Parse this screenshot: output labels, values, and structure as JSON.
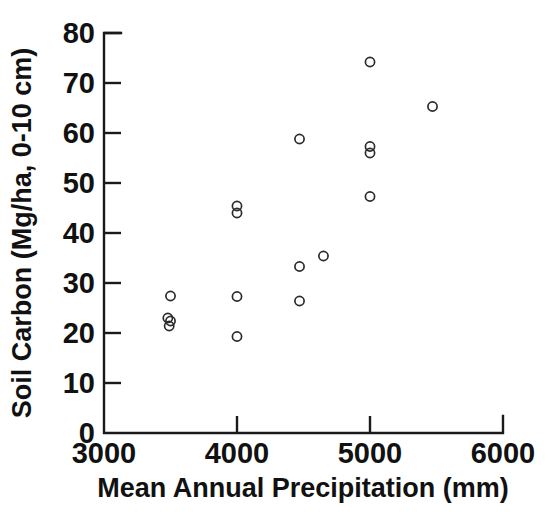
{
  "chart_data": {
    "type": "scatter",
    "title": "",
    "xlabel": "Mean Annual Precipitation  (mm)",
    "ylabel": "Soil Carbon (Mg/ha, 0-10 cm)",
    "xlim": [
      3000,
      6000
    ],
    "ylim": [
      0,
      80
    ],
    "xticks": [
      3000,
      4000,
      5000,
      6000
    ],
    "xtick_labels": [
      "3000",
      "4000",
      "5000",
      "6000"
    ],
    "yticks": [
      0,
      10,
      20,
      30,
      40,
      50,
      60,
      70,
      80
    ],
    "ytick_labels": [
      "0",
      "10",
      "20",
      "30",
      "40",
      "50",
      "60",
      "70",
      "80"
    ],
    "grid": false,
    "legend": null,
    "marker": "open-circle",
    "marker_color": "#2b2b2b",
    "points": [
      {
        "x": 3500,
        "y": 27.4
      },
      {
        "x": 3480,
        "y": 23.0
      },
      {
        "x": 3500,
        "y": 22.4
      },
      {
        "x": 3490,
        "y": 21.4
      },
      {
        "x": 4000,
        "y": 45.4
      },
      {
        "x": 4000,
        "y": 44.0
      },
      {
        "x": 4000,
        "y": 27.3
      },
      {
        "x": 4000,
        "y": 19.3
      },
      {
        "x": 4470,
        "y": 58.8
      },
      {
        "x": 4470,
        "y": 33.3
      },
      {
        "x": 4650,
        "y": 35.4
      },
      {
        "x": 4470,
        "y": 26.4
      },
      {
        "x": 5000,
        "y": 74.2
      },
      {
        "x": 5000,
        "y": 57.3
      },
      {
        "x": 5000,
        "y": 56.0
      },
      {
        "x": 5000,
        "y": 47.3
      },
      {
        "x": 5470,
        "y": 65.3
      }
    ]
  },
  "axes": {
    "x_tick_labels": [
      "3000",
      "4000",
      "5000",
      "6000"
    ],
    "y_tick_labels": [
      "80",
      "70",
      "60",
      "50",
      "40",
      "30",
      "20",
      "10",
      "0"
    ],
    "x_title": "Mean Annual Precipitation  (mm)",
    "y_title": "Soil Carbon (Mg/ha, 0-10 cm)"
  }
}
